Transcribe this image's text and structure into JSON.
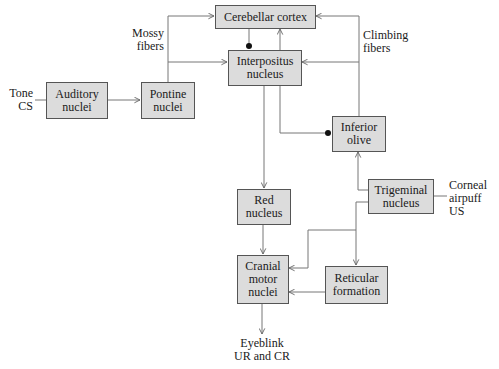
{
  "diagram": {
    "type": "neural-circuit-block-diagram",
    "nodes": [
      {
        "id": "cerebellar_cortex",
        "label": "Cerebellar cortex"
      },
      {
        "id": "interpositus",
        "label": "Interpositus\nnucleus"
      },
      {
        "id": "auditory",
        "label": "Auditory\nnuclei"
      },
      {
        "id": "pontine",
        "label": "Pontine\nnuclei"
      },
      {
        "id": "inferior_olive",
        "label": "Inferior\nolive"
      },
      {
        "id": "trigeminal",
        "label": "Trigeminal\nnucleus"
      },
      {
        "id": "red_nucleus",
        "label": "Red\nnucleus"
      },
      {
        "id": "cranial_motor",
        "label": "Cranial\nmotor\nnuclei"
      },
      {
        "id": "reticular",
        "label": "Reticular\nformation"
      }
    ],
    "labels": {
      "tone_cs": "Tone\nCS",
      "mossy_fibers": "Mossy\nfibers",
      "climbing_fibers": "Climbing\nfibers",
      "corneal_airpuff": "Corneal\nairpuff\nUS",
      "eyeblink": "Eyeblink\nUR and CR"
    },
    "edges": [
      {
        "from": "tone_cs",
        "to": "auditory",
        "type": "line"
      },
      {
        "from": "auditory",
        "to": "pontine",
        "type": "excitatory"
      },
      {
        "from": "pontine",
        "to": "cerebellar_cortex",
        "type": "excitatory",
        "via": "mossy fibers"
      },
      {
        "from": "pontine",
        "to": "interpositus",
        "type": "excitatory",
        "via": "mossy fibers"
      },
      {
        "from": "cerebellar_cortex",
        "to": "interpositus",
        "type": "inhibitory"
      },
      {
        "from": "interpositus",
        "to": "cerebellar_cortex",
        "type": "excitatory"
      },
      {
        "from": "inferior_olive",
        "to": "cerebellar_cortex",
        "type": "excitatory",
        "via": "climbing fibers"
      },
      {
        "from": "inferior_olive",
        "to": "interpositus",
        "type": "excitatory",
        "via": "climbing fibers"
      },
      {
        "from": "interpositus",
        "to": "inferior_olive",
        "type": "inhibitory"
      },
      {
        "from": "interpositus",
        "to": "red_nucleus",
        "type": "excitatory"
      },
      {
        "from": "trigeminal",
        "to": "inferior_olive",
        "type": "excitatory"
      },
      {
        "from": "corneal_airpuff",
        "to": "trigeminal",
        "type": "line"
      },
      {
        "from": "trigeminal",
        "to": "cranial_motor",
        "type": "excitatory"
      },
      {
        "from": "trigeminal",
        "to": "reticular",
        "type": "excitatory"
      },
      {
        "from": "red_nucleus",
        "to": "cranial_motor",
        "type": "excitatory"
      },
      {
        "from": "reticular",
        "to": "cranial_motor",
        "type": "excitatory"
      },
      {
        "from": "cranial_motor",
        "to": "eyeblink",
        "type": "excitatory"
      }
    ]
  },
  "colors": {
    "box_fill": "#dcdcdc",
    "box_border": "#555555",
    "line": "#666666"
  }
}
